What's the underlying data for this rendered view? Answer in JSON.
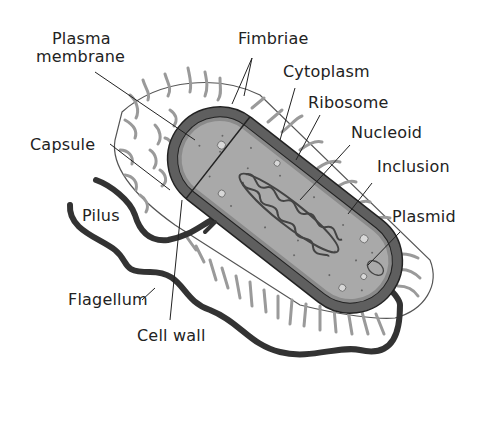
{
  "colors": {
    "background": "#ffffff",
    "cell_wall": "#5f5f5f",
    "membrane": "#8a8a8a",
    "cytoplasm": "#a9a9a9",
    "nucleoid": "#444444",
    "flagellum": "#333333",
    "fimbriae": "#9a9a9a",
    "capsule_outline": "#555555",
    "text": "#222222"
  },
  "labels": {
    "plasma_membrane_line1": "Plasma",
    "plasma_membrane_line2": "membrane",
    "fimbriae": "Fimbriae",
    "cytoplasm": "Cytoplasm",
    "ribosome": "Ribosome",
    "nucleoid": "Nucleoid",
    "inclusion": "Inclusion",
    "capsule": "Capsule",
    "plasmid": "Plasmid",
    "pilus": "Pilus",
    "flagellum": "Flagellum",
    "cell_wall": "Cell wall"
  }
}
